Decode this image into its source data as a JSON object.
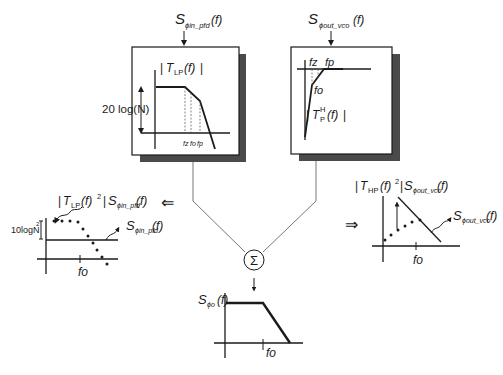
{
  "inputs": {
    "pfd_noise": {
      "S": "S",
      "sub": "ϕin_pfd",
      "arg": "(f)"
    },
    "vco_noise": {
      "S": "S",
      "sub": "ϕout_vco",
      "arg": "(f)"
    }
  },
  "lowpass_box": {
    "title": "| TLP(f) |",
    "title_T": "T",
    "title_sub": "LP",
    "title_arg": "(f)",
    "gain_label": "20 log(N)",
    "freq_labels": [
      "fz",
      "fo",
      "fp"
    ]
  },
  "highpass_box": {
    "title_T": "T",
    "title_sub": "P",
    "title_sup": "H",
    "title_arg": "(f)",
    "freq_labels": {
      "fz": "fz",
      "fp": "fp",
      "fo": "fo"
    }
  },
  "left_plot": {
    "result_label": {
      "T": "T",
      "sub": "LP",
      "mid": "(f)",
      "sup": "2",
      "S": "S",
      "Ssub": "ϕin_pfd",
      "arg": "(f)"
    },
    "input_label": {
      "S": "S",
      "sub": "ϕin_pfd",
      "arg": "(f)"
    },
    "gain_label": "10logN",
    "gain_sup": "2",
    "x_tick": "fo",
    "arrow": "⇐"
  },
  "right_plot": {
    "result_label": {
      "T": "T",
      "sub": "HP",
      "mid": "(f)",
      "sup": "2",
      "S": "S",
      "Ssub": "ϕout_vco",
      "arg": "(f)"
    },
    "input_label": {
      "S": "S",
      "sub": "ϕout_vco",
      "arg": "(f)"
    },
    "x_tick": "fo",
    "arrow": "⇒"
  },
  "summer": {
    "symbol": "Σ"
  },
  "output_plot": {
    "label": {
      "S": "S",
      "sub": "ϕo",
      "arg": "(f)"
    },
    "x_tick": "fo"
  }
}
